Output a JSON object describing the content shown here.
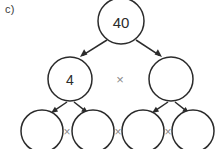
{
  "diagram": {
    "kind": "factor-tree",
    "part_label": "c)",
    "colors": {
      "stroke": "#2b2b2b",
      "background": "#ffffff",
      "operator": "#8a8a8a",
      "label": "#3a3a3a"
    },
    "operator_symbol": "×",
    "rows": [
      {
        "name": "root",
        "nodes": [
          {
            "id": "n0",
            "value": "40",
            "cx": 121,
            "cy": 21,
            "r": 23,
            "filled": true
          }
        ],
        "operators": []
      },
      {
        "name": "level-1",
        "nodes": [
          {
            "id": "n1",
            "value": "4",
            "cx": 70,
            "cy": 79,
            "r": 22,
            "filled": true
          },
          {
            "id": "n2",
            "value": "",
            "cx": 171,
            "cy": 79,
            "r": 22,
            "filled": false
          }
        ],
        "operators": [
          {
            "id": "op1",
            "symbol": "×",
            "x": 120,
            "y": 79
          }
        ]
      },
      {
        "name": "level-2",
        "nodes": [
          {
            "id": "n3",
            "value": "",
            "cx": 42,
            "cy": 131,
            "r": 21,
            "filled": false
          },
          {
            "id": "n4",
            "value": "",
            "cx": 93,
            "cy": 131,
            "r": 21,
            "filled": false
          },
          {
            "id": "n5",
            "value": "",
            "cx": 143,
            "cy": 131,
            "r": 21,
            "filled": false
          },
          {
            "id": "n6",
            "value": "",
            "cx": 193,
            "cy": 131,
            "r": 21,
            "filled": false
          }
        ],
        "operators": [
          {
            "id": "op2",
            "symbol": "×",
            "x": 67,
            "y": 132
          },
          {
            "id": "op3",
            "symbol": "×",
            "x": 118,
            "y": 132
          },
          {
            "id": "op4",
            "symbol": "×",
            "x": 168,
            "y": 132
          }
        ]
      }
    ],
    "arrows": [
      {
        "id": "a1",
        "from": "n0",
        "to": "n1",
        "x1": 107,
        "y1": 40,
        "x2": 80,
        "y2": 57
      },
      {
        "id": "a2",
        "from": "n0",
        "to": "n2",
        "x1": 136,
        "y1": 40,
        "x2": 162,
        "y2": 57
      },
      {
        "id": "a3",
        "from": "n1",
        "to": "n3",
        "x1": 67,
        "y1": 102,
        "x2": 51,
        "y2": 113
      },
      {
        "id": "a4",
        "from": "n1",
        "to": "n4",
        "x1": 74,
        "y1": 102,
        "x2": 88,
        "y2": 113
      },
      {
        "id": "a5",
        "from": "n2",
        "to": "n5",
        "x1": 168,
        "y1": 102,
        "x2": 152,
        "y2": 113
      },
      {
        "id": "a6",
        "from": "n2",
        "to": "n6",
        "x1": 175,
        "y1": 102,
        "x2": 189,
        "y2": 113
      }
    ]
  }
}
